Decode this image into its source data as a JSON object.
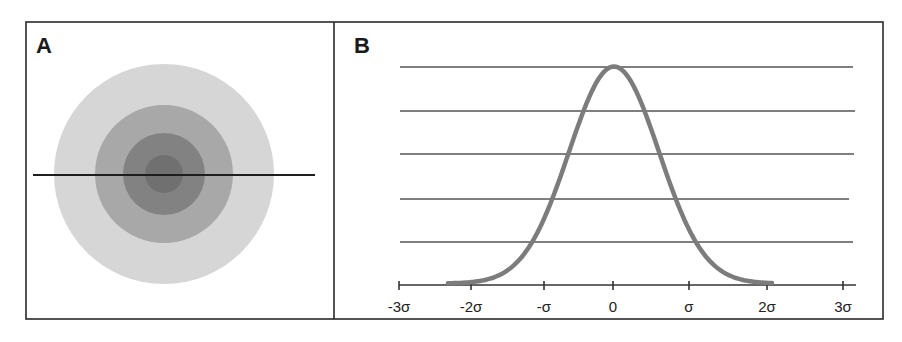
{
  "figure": {
    "frame": {
      "x1": 26,
      "y1": 22,
      "x2": 883,
      "y2": 319,
      "divider_x": 334,
      "color": "#2a2a2a"
    },
    "panel_a": {
      "label": "A",
      "label_pos": [
        36,
        53
      ],
      "center": [
        164,
        174
      ],
      "rings": [
        {
          "name": "outer-ring",
          "r": 110,
          "color": "#d6d6d6"
        },
        {
          "name": "middle-ring",
          "r": 69,
          "color": "#a8a8a8"
        },
        {
          "name": "inner-ring",
          "r": 41,
          "color": "#828282"
        },
        {
          "name": "core",
          "r": 19,
          "color": "#707070"
        }
      ],
      "cross_line": {
        "x1": 33,
        "x2": 315,
        "y": 175,
        "color": "#1e1e1e"
      }
    },
    "panel_b": {
      "label": "B",
      "label_pos": [
        354,
        53
      ],
      "gridlines": [
        {
          "y": 67,
          "x1": 400,
          "x2": 853
        },
        {
          "y": 111,
          "x1": 400,
          "x2": 855
        },
        {
          "y": 154,
          "x1": 400,
          "x2": 854
        },
        {
          "y": 199,
          "x1": 400,
          "x2": 849
        },
        {
          "y": 242,
          "x1": 400,
          "x2": 853
        }
      ],
      "gridline_color": "#555555",
      "axis": {
        "y": 285,
        "x1": 399,
        "x2": 856,
        "color": "#333333"
      },
      "ticks": [
        {
          "x": 399,
          "label": "-3σ"
        },
        {
          "x": 471,
          "label": "-2σ"
        },
        {
          "x": 544,
          "label": "-σ"
        },
        {
          "x": 613,
          "label": "0"
        },
        {
          "x": 689,
          "label": "σ"
        },
        {
          "x": 767,
          "label": "2σ"
        },
        {
          "x": 843,
          "label": "3σ"
        }
      ],
      "tick_label_y": 312,
      "curve": {
        "color": "#7c7c7c",
        "stroke_width": 4.5,
        "mu_px": 614,
        "sigma_px": 45,
        "peak_y": 68,
        "base_y": 285,
        "x_start": 448,
        "x_end": 773
      }
    }
  },
  "chart_data": {
    "type": "line",
    "title": "",
    "panels": [
      {
        "label": "A",
        "kind": "concentric-circles",
        "description": "Radially symmetric intensity profile shown as concentric gray discs, darkest at center, with a horizontal cross-section line through the center",
        "ring_count": 4
      },
      {
        "label": "B",
        "kind": "gaussian-profile",
        "xlabel": "",
        "ylabel": "",
        "x_ticks": [
          "-3σ",
          "-2σ",
          "-σ",
          "0",
          "σ",
          "2σ",
          "3σ"
        ],
        "x_tick_values": [
          -3,
          -2,
          -1,
          0,
          1,
          2,
          3
        ],
        "xlim": [
          -3,
          3
        ],
        "ylim": [
          0,
          1
        ],
        "grid": "horizontal",
        "gridline_count": 5,
        "series": [
          {
            "name": "normal distribution",
            "x": [
              -2.2,
              -2,
              -1.5,
              -1,
              -0.5,
              0,
              0.5,
              1,
              1.5,
              2,
              2.1
            ],
            "y": [
              0.01,
              0.02,
              0.1,
              0.27,
              0.67,
              1.0,
              0.67,
              0.27,
              0.1,
              0.02,
              0.01
            ]
          }
        ]
      }
    ]
  }
}
